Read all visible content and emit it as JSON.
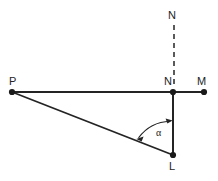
{
  "diagram": {
    "kind": "geometry-line-diagram",
    "width": 218,
    "height": 181,
    "background_color": "#ffffff",
    "stroke_color": "#242424",
    "label_color": "#242424",
    "points": [
      {
        "id": "P",
        "label": "P",
        "x": 12,
        "y": 92,
        "label_x": 9,
        "label_y": 76,
        "marker": "dot"
      },
      {
        "id": "N",
        "label": "N",
        "x": 173,
        "y": 92,
        "label_x": 164,
        "label_y": 76,
        "marker": "dot"
      },
      {
        "id": "M",
        "label": "M",
        "x": 204,
        "y": 92,
        "label_x": 197,
        "label_y": 76,
        "marker": "dot"
      },
      {
        "id": "L",
        "label": "L",
        "x": 173,
        "y": 155,
        "label_x": 169,
        "label_y": 161,
        "marker": "dot"
      },
      {
        "id": "Ntop",
        "label": "N",
        "x": 174,
        "y": 25,
        "label_x": 168,
        "label_y": 10,
        "marker": "none"
      }
    ],
    "segments": [
      {
        "id": "PM",
        "from": "P",
        "to": "M",
        "style": "solid",
        "x1": 12,
        "y1": 92,
        "x2": 205,
        "y2": 92
      },
      {
        "id": "PL",
        "from": "P",
        "to": "L",
        "style": "solid",
        "x1": 12,
        "y1": 92,
        "x2": 173,
        "y2": 155
      },
      {
        "id": "NL",
        "from": "N",
        "to": "L",
        "style": "solid",
        "x1": 173,
        "y1": 92,
        "x2": 173,
        "y2": 155
      },
      {
        "id": "NtopN",
        "from": "Ntop",
        "to": "N",
        "style": "dashed",
        "x1": 174,
        "y1": 25,
        "x2": 174,
        "y2": 88
      }
    ],
    "angle": {
      "id": "alpha",
      "symbol": "α",
      "vertex": "L",
      "between": [
        "LP",
        "LN"
      ],
      "label_x": 156,
      "label_y": 128,
      "arc_path": "M 138.5 137.5 A 40 40 0 0 1 170.5 121.5",
      "arrowheads": "both"
    }
  }
}
